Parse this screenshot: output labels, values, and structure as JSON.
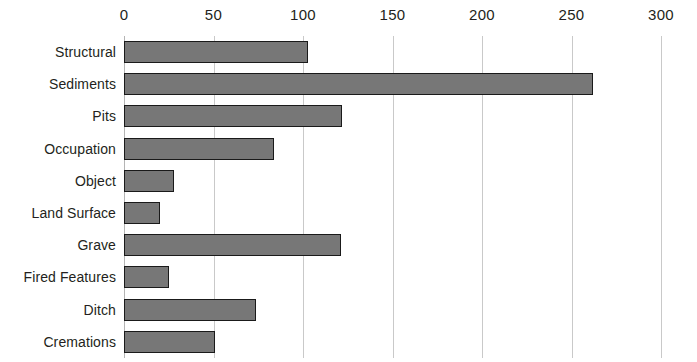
{
  "chart_data": {
    "type": "bar",
    "orientation": "horizontal",
    "title": "",
    "subtitle": "",
    "xlabel": "",
    "ylabel": "",
    "categories": [
      "Structural",
      "Sediments",
      "Pits",
      "Occupation",
      "Object",
      "Land Surface",
      "Grave",
      "Fired Features",
      "Ditch",
      "Cremations"
    ],
    "values": [
      103,
      262,
      122,
      84,
      28,
      20,
      121,
      25,
      74,
      51
    ],
    "xlim": [
      0,
      300
    ],
    "xticks": [
      0,
      50,
      100,
      150,
      200,
      250,
      300
    ],
    "xtick_labels": [
      "0",
      "50",
      "100",
      "150",
      "200",
      "250",
      "300"
    ],
    "grid": true,
    "grid_axis": "x",
    "legend": false,
    "legend_position": "none",
    "axis_position": "top",
    "colors": {
      "bar_fill": "#777777",
      "bar_border": "#1a1a1a",
      "gridline": "#c9c9c9",
      "text": "#231f20",
      "background": "#ffffff"
    }
  }
}
